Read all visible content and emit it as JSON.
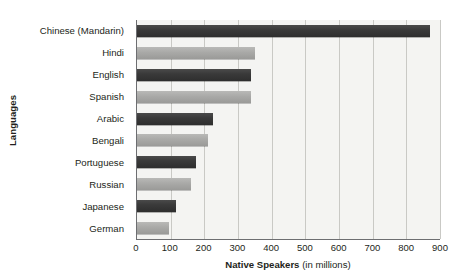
{
  "chart_data": {
    "type": "bar",
    "orientation": "horizontal",
    "title": "",
    "xlabel_bold": "Native Speakers",
    "xlabel_rest": " (in millions)",
    "ylabel": "Languages",
    "xlim": [
      0,
      900
    ],
    "xticks": [
      0,
      100,
      200,
      300,
      400,
      500,
      600,
      700,
      800,
      900
    ],
    "xtick_labels": [
      "0",
      "100",
      "200",
      "300",
      "400",
      "500",
      "600",
      "700",
      "800",
      "900"
    ],
    "grid": "vertical",
    "legend": "none",
    "categories": [
      "Chinese (Mandarin)",
      "Hindi",
      "English",
      "Spanish",
      "Arabic",
      "Bengali",
      "Portuguese",
      "Russian",
      "Japanese",
      "German"
    ],
    "values": [
      870,
      350,
      340,
      340,
      225,
      210,
      175,
      160,
      115,
      95
    ],
    "bar_shades": [
      "dark",
      "light",
      "dark",
      "light",
      "dark",
      "light",
      "dark",
      "light",
      "dark",
      "light"
    ],
    "colors": {
      "bar_dark": "#3a3a3a",
      "bar_light": "#a9a9a7",
      "plot_background": "#f4f4f2",
      "gridline": "#c9c9c5",
      "axis_line": "#6d6e71",
      "text": "#231f20"
    }
  }
}
